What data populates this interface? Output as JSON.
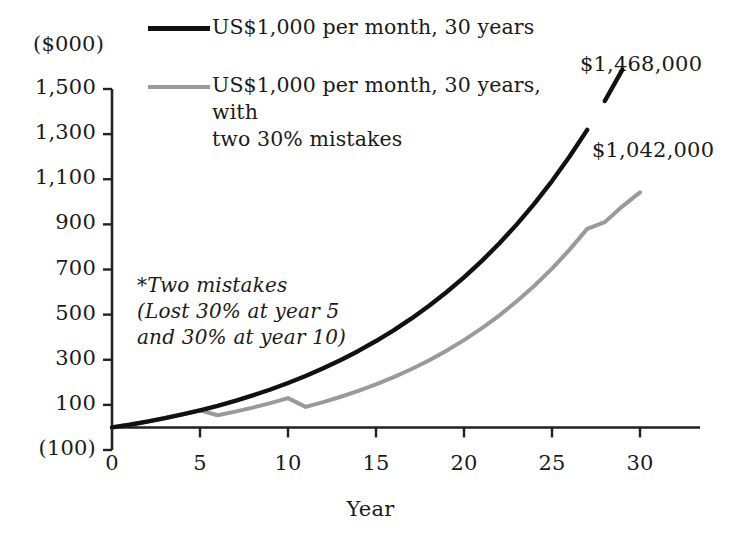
{
  "chart_data": {
    "type": "line",
    "title": "",
    "xlabel": "Year",
    "ylabel": "($000)",
    "y_unit_label": "($000)",
    "xlim": [
      0,
      30
    ],
    "ylim": [
      -100,
      1500
    ],
    "grid": false,
    "legend_position": "top-center",
    "x_ticks": [
      "0",
      "5",
      "10",
      "15",
      "20",
      "25",
      "30"
    ],
    "x_tick_values": [
      0,
      5,
      10,
      15,
      20,
      25,
      30
    ],
    "y_ticks": [
      "1,500",
      "1,300",
      "1,100",
      "900",
      "700",
      "500",
      "300",
      "100",
      "(100)"
    ],
    "y_tick_values": [
      1500,
      1300,
      1100,
      900,
      700,
      500,
      300,
      100,
      -100
    ],
    "x": [
      0,
      1,
      2,
      3,
      4,
      5,
      6,
      7,
      8,
      9,
      10,
      11,
      12,
      13,
      14,
      15,
      16,
      17,
      18,
      19,
      20,
      21,
      22,
      23,
      24,
      25,
      26,
      27,
      28,
      29,
      30
    ],
    "series": [
      {
        "name": "US$1,000 per month, 30 years",
        "color": "#111111",
        "end_label": "$1,468,000",
        "end_value": 1468,
        "values": [
          0,
          12,
          26,
          41,
          58,
          76,
          96,
          118,
          142,
          168,
          197,
          228,
          262,
          299,
          339,
          383,
          430,
          482,
          538,
          599,
          665,
          737,
          815,
          900,
          992,
          1092,
          1201,
          1319,
          1447,
          1586,
          1468
        ]
      },
      {
        "name": "US$1,000 per month, 30 years, with\ntwo 30% mistakes",
        "color": "#9a9a9a",
        "end_label": "$1,042,000",
        "end_value": 1042,
        "values": [
          0,
          12,
          26,
          41,
          58,
          76,
          54,
          70,
          88,
          108,
          130,
          91,
          112,
          136,
          162,
          191,
          223,
          258,
          297,
          340,
          387,
          439,
          496,
          559,
          628,
          704,
          788,
          880,
          910,
          980,
          1042
        ]
      }
    ],
    "annotations": [
      {
        "name": "two-mistakes-note",
        "text": "*Two mistakes\n (Lost 30% at year 5\nand 30% at year 10)",
        "style": "italic"
      }
    ],
    "end_labels": {
      "black_series": "$1,468,000",
      "gray_series": "$1,042,000"
    }
  },
  "legend": {
    "items": [
      {
        "label": "US$1,000 per month, 30 years",
        "swatch": "solid-black-line",
        "color": "#111111"
      },
      {
        "label": "US$1,000 per month, 30 years, with\ntwo 30% mistakes",
        "swatch": "solid-gray-line",
        "color": "#9a9a9a"
      }
    ]
  },
  "axes": {
    "y_unit": "($000)",
    "x_title": "Year",
    "y_labels": [
      "1,500",
      "1,300",
      "1,100",
      "900",
      "700",
      "500",
      "300",
      "100",
      "(100)"
    ],
    "x_labels": [
      "0",
      "5",
      "10",
      "15",
      "20",
      "25",
      "30"
    ]
  },
  "annotation_note": "*Two mistakes\n (Lost 30% at year 5\nand 30% at year 10)",
  "value_labels": {
    "black": "$1,468,000",
    "gray": "$1,042,000"
  },
  "colors": {
    "black_series": "#111111",
    "gray_series": "#9a9a9a",
    "axis": "#222222",
    "background": "#ffffff"
  }
}
